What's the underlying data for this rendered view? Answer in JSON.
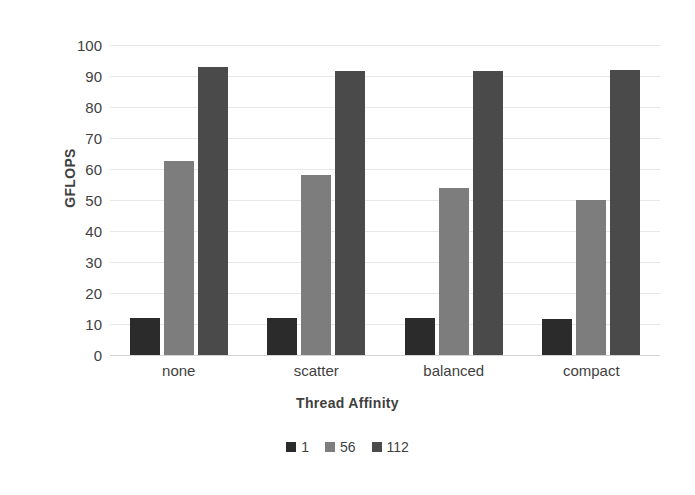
{
  "chart_data": {
    "type": "bar",
    "title": "",
    "xlabel": "Thread Affinity",
    "ylabel": "GFLOPS",
    "categories": [
      "none",
      "scatter",
      "balanced",
      "compact"
    ],
    "series": [
      {
        "name": "1",
        "color": "#2b2b2b",
        "values": [
          12,
          12,
          12,
          11.5
        ]
      },
      {
        "name": "56",
        "color": "#7d7d7d",
        "values": [
          62.5,
          58,
          54,
          50
        ]
      },
      {
        "name": "112",
        "color": "#4a4a4a",
        "values": [
          93,
          91.5,
          91.5,
          92
        ]
      }
    ],
    "ylim": [
      0,
      100
    ],
    "ytick_step": 10,
    "yticks": [
      "100",
      "90",
      "80",
      "70",
      "60",
      "50",
      "40",
      "30",
      "20",
      "10",
      "0"
    ],
    "grid": true,
    "legend_position": "bottom",
    "background_color": "#ffffff",
    "gridline_color": "#e8e8e8",
    "text_color": "#3f3f3f"
  }
}
